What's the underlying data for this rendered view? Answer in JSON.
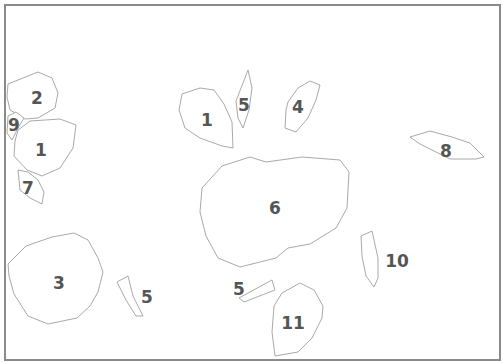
{
  "diagram": {
    "frame": {
      "x": 5,
      "y": 5,
      "width": 495,
      "height": 355,
      "stroke": "#8a8a8a"
    },
    "region_stroke": "#a9a9a9",
    "label_color": "#555555",
    "regions": [
      {
        "label": "2",
        "points": "8,84 38,72 52,78 58,93 55,108 38,118 25,119 10,110 7,97",
        "lx": 37,
        "ly": 98
      },
      {
        "label": "9",
        "points": "8,116 16,112 24,118 18,128 12,140 7,133",
        "lx": 14,
        "ly": 125
      },
      {
        "label": "1",
        "points": "18,130 30,121 60,119 76,125 73,148 60,168 42,176 27,170 14,156 15,141",
        "lx": 41,
        "ly": 150
      },
      {
        "label": "7",
        "points": "18,170 28,172 38,180 44,192 42,204 30,198 20,190",
        "lx": 28,
        "ly": 188
      },
      {
        "label": "3",
        "points": "8,264 26,246 52,237 74,233 88,240 98,258 103,272 98,292 90,306 77,318 48,324 28,316 14,294 9,276",
        "lx": 59,
        "ly": 283
      },
      {
        "label": "5",
        "points": "117,282 128,276 133,296 143,316 136,316 126,300",
        "lx": 147,
        "ly": 297
      },
      {
        "label": "1",
        "points": "182,94 200,88 214,90 224,104 232,122 233,148 222,146 200,138 185,128 179,110",
        "lx": 207,
        "ly": 120
      },
      {
        "label": "5",
        "points": "236,101 248,70 252,88 249,110 243,128 238,118",
        "lx": 244,
        "ly": 105
      },
      {
        "label": "4",
        "points": "288,102 298,88 310,81 320,85 316,100 308,118 296,132 285,128 286,110",
        "lx": 298,
        "ly": 107
      },
      {
        "label": "6",
        "points": "202,188 222,166 250,157 266,162 302,157 340,160 349,172 347,208 336,228 310,244 288,248 276,258 240,267 218,258 206,236 200,212",
        "lx": 275,
        "ly": 208
      },
      {
        "label": "5",
        "points": "239,298 272,280 275,290 244,302",
        "lx": 239,
        "ly": 289
      },
      {
        "label": "11",
        "points": "282,293 300,283 314,290 323,306 322,318 312,338 298,352 275,356 272,332 274,306",
        "lx": 293,
        "ly": 323
      },
      {
        "label": "10",
        "points": "361,236 372,231 378,258 378,278 374,287 366,276 362,256",
        "lx": 397,
        "ly": 261
      },
      {
        "label": "8",
        "points": "410,137 430,131 452,137 470,143 484,157 476,159 450,159 436,152 420,144",
        "lx": 446,
        "ly": 151
      }
    ]
  }
}
